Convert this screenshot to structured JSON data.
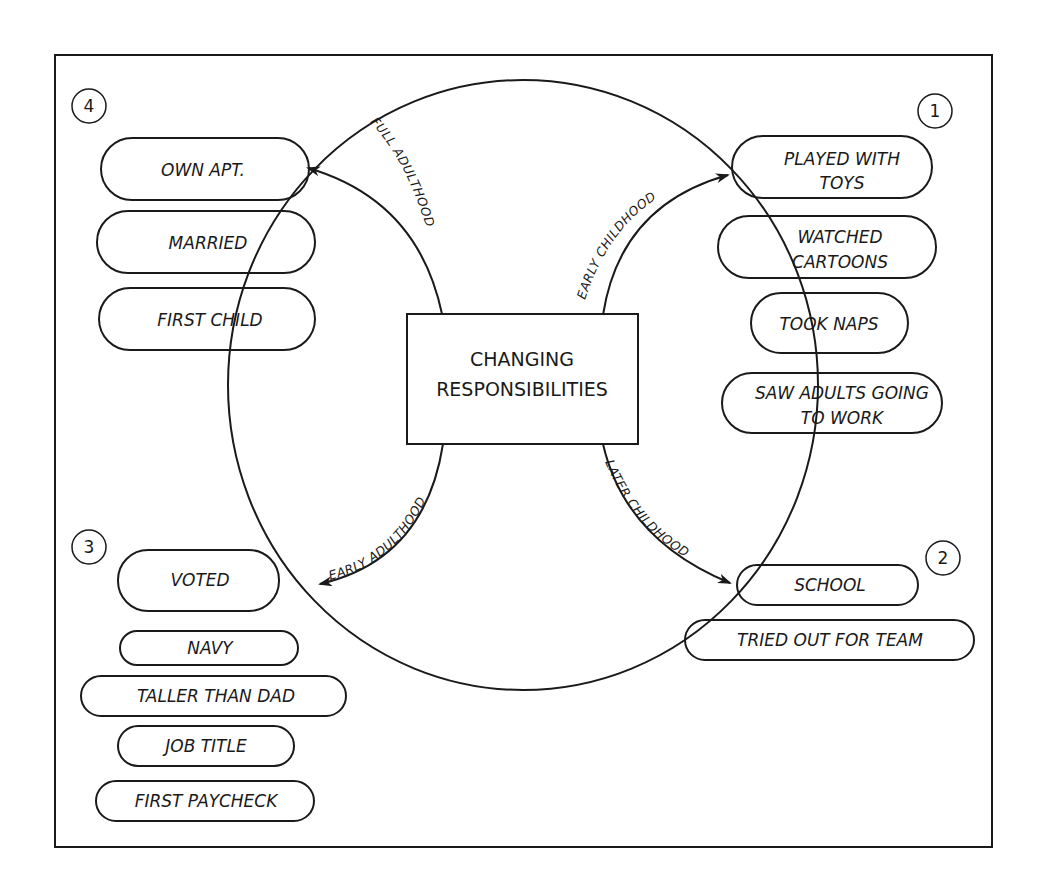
{
  "diagram": {
    "center": {
      "line1": "CHANGING",
      "line2": "RESPONSIBILITIES"
    },
    "stages": [
      {
        "number": "1",
        "arc_label": "EARLY CHILDHOOD",
        "items": [
          {
            "line1": "PLAYED WITH",
            "line2": "TOYS"
          },
          {
            "line1": "WATCHED",
            "line2": "CARTOONS"
          },
          {
            "line1": "TOOK NAPS"
          },
          {
            "line1": "SAW ADULTS GOING",
            "line2": "TO WORK"
          }
        ]
      },
      {
        "number": "2",
        "arc_label": "LATER CHILDHOOD",
        "items": [
          {
            "line1": "SCHOOL"
          },
          {
            "line1": "TRIED OUT FOR TEAM"
          }
        ]
      },
      {
        "number": "3",
        "arc_label": "EARLY ADULTHOOD",
        "items": [
          {
            "line1": "VOTED"
          },
          {
            "line1": "NAVY"
          },
          {
            "line1": "TALLER THAN DAD"
          },
          {
            "line1": "JOB TITLE"
          },
          {
            "line1": "FIRST PAYCHECK"
          }
        ]
      },
      {
        "number": "4",
        "arc_label": "FULL ADULTHOOD",
        "items": [
          {
            "line1": "OWN APT."
          },
          {
            "line1": "MARRIED"
          },
          {
            "line1": "FIRST CHILD"
          }
        ]
      }
    ]
  }
}
